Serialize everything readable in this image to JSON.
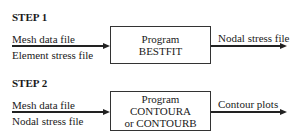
{
  "step1": {
    "title": "STEP 1",
    "inputs": [
      "Mesh data file",
      "Element stress file"
    ],
    "program": [
      "Program",
      "BESTFIT"
    ],
    "output": "Nodal stress file"
  },
  "step2": {
    "title": "STEP 2",
    "inputs": [
      "Mesh data file",
      "Nodal stress file"
    ],
    "program": [
      "Program",
      "CONTOURA",
      "or CONTOURB"
    ],
    "output": "Contour plots"
  }
}
